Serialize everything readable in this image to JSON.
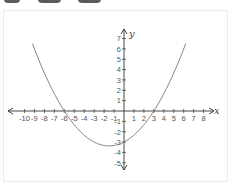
{
  "toolbar": {
    "tabs": [
      {
        "label": "",
        "x": 4,
        "w": 16
      },
      {
        "label": "",
        "x": 38,
        "w": 23
      },
      {
        "label": "",
        "x": 78,
        "w": 23
      }
    ]
  },
  "chart_data": {
    "type": "line",
    "title": "",
    "xlabel": "x",
    "ylabel": "y",
    "function": "y = (1/6)(x + 6)(x - 3)",
    "xlim": [
      -10.5,
      8.8
    ],
    "ylim": [
      -5.8,
      7.8
    ],
    "x_ticks": [
      -10,
      -9,
      -8,
      -7,
      -6,
      -5,
      -4,
      -3,
      -2,
      -1,
      1,
      2,
      3,
      4,
      5,
      6,
      7,
      8
    ],
    "y_ticks": [
      -5,
      -4,
      -3,
      -2,
      -1,
      1,
      2,
      3,
      4,
      5,
      6,
      7
    ],
    "roots": [
      -6,
      3
    ],
    "y_intercept": -3,
    "vertex": [
      -1.5,
      -3.375
    ],
    "grid": false,
    "series": [
      {
        "name": "parabola",
        "x_range": [
          -9.2,
          6.2
        ],
        "color": "#777777"
      }
    ]
  },
  "colors": {
    "axis": "#333333",
    "curve": "#7a7a7a",
    "tab": "#5a5a5a",
    "frame": "#ececec"
  }
}
